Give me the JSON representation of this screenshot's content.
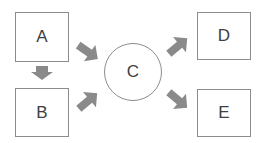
{
  "diagram": {
    "nodes": [
      {
        "id": "A",
        "label": "A",
        "shape": "rectangle"
      },
      {
        "id": "B",
        "label": "B",
        "shape": "rectangle"
      },
      {
        "id": "C",
        "label": "C",
        "shape": "circle"
      },
      {
        "id": "D",
        "label": "D",
        "shape": "rectangle"
      },
      {
        "id": "E",
        "label": "E",
        "shape": "rectangle"
      }
    ],
    "edges": [
      {
        "from": "A",
        "to": "B"
      },
      {
        "from": "A",
        "to": "C"
      },
      {
        "from": "B",
        "to": "C"
      },
      {
        "from": "C",
        "to": "D"
      },
      {
        "from": "C",
        "to": "E"
      }
    ],
    "colors": {
      "border": "#8c8c8c",
      "arrow": "#8a8a8a",
      "text": "#404040",
      "background": "#ffffff"
    }
  }
}
